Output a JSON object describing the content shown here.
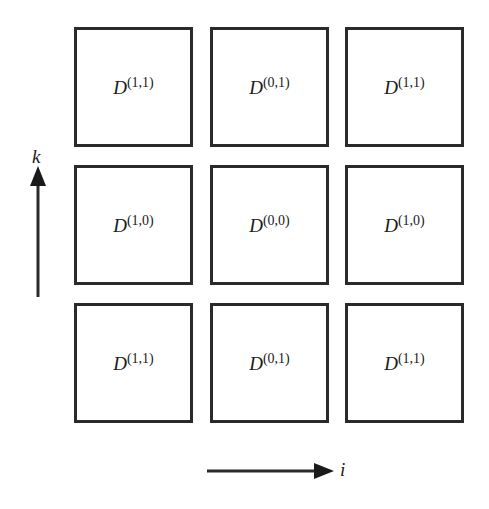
{
  "diagram": {
    "grid": [
      [
        {
          "base": "D",
          "superscript": "(1,1)"
        },
        {
          "base": "D",
          "superscript": "(0,1)"
        },
        {
          "base": "D",
          "superscript": "(1,1)"
        }
      ],
      [
        {
          "base": "D",
          "superscript": "(1,0)"
        },
        {
          "base": "D",
          "superscript": "(0,0)"
        },
        {
          "base": "D",
          "superscript": "(1,0)"
        }
      ],
      [
        {
          "base": "D",
          "superscript": "(1,1)"
        },
        {
          "base": "D",
          "superscript": "(0,1)"
        },
        {
          "base": "D",
          "superscript": "(1,1)"
        }
      ]
    ],
    "axes": {
      "vertical_label": "k",
      "horizontal_label": "i"
    },
    "colors": {
      "stroke": "#2a2a2a",
      "background": "#ffffff"
    }
  }
}
